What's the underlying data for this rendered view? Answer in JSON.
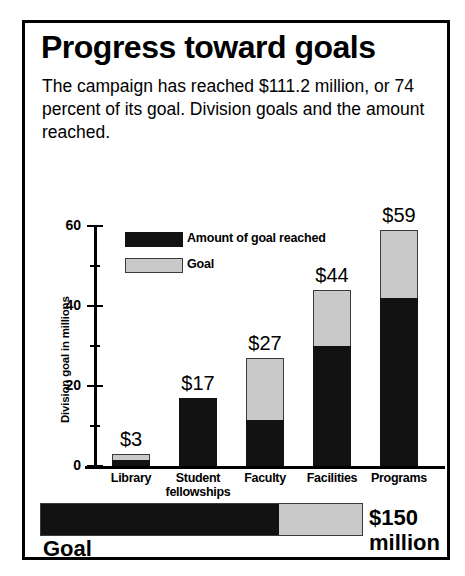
{
  "title": "Progress toward goals",
  "subtitle": "The campaign has reached $111.2 million, or 74 percent of its goal. Division goals and the amount reached.",
  "legend": [
    {
      "label": "Amount of goal reached",
      "swatch": "black"
    },
    {
      "label": "Goal",
      "swatch": "gray"
    }
  ],
  "goal_summary": {
    "label": "Goal",
    "amount": "$150",
    "unit": "million",
    "percent_reached": 74
  },
  "chart_data": {
    "type": "bar",
    "subtype": "stacked",
    "title": "Progress toward goals",
    "xlabel": "",
    "ylabel": "Division goal in millions",
    "ylim": [
      0,
      60
    ],
    "yticks": [
      0,
      20,
      40,
      60
    ],
    "yticks_minor": [
      10,
      30,
      50
    ],
    "grid": false,
    "legend_position": "upper-left-inside",
    "categories": [
      "Library",
      "Student fellowships",
      "Faculty",
      "Facilities",
      "Programs"
    ],
    "series": [
      {
        "name": "Amount of goal reached",
        "color": "#121212",
        "values": [
          1.5,
          17,
          11.5,
          30,
          42
        ]
      },
      {
        "name": "Goal",
        "color": "#c9c9c9",
        "values": [
          3,
          17,
          27,
          44,
          59
        ]
      }
    ],
    "data_labels": [
      "$3",
      "$17",
      "$27",
      "$44",
      "$59"
    ],
    "ytick_labels": [
      "0",
      "20",
      "40",
      "60"
    ]
  }
}
